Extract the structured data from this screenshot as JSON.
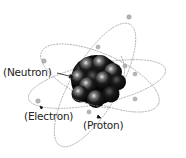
{
  "diagram": {
    "labels": {
      "neutron": "(Neutron)",
      "electron": "(Electron)",
      "proton": "(Proton)"
    },
    "colors": {
      "orbit": "#9a9a9a",
      "electron": "#b5b5b5",
      "nucleus_dark": "#0c0c0c",
      "nucleus_highlight": "#e6e6e6",
      "label_text": "#222222"
    }
  }
}
